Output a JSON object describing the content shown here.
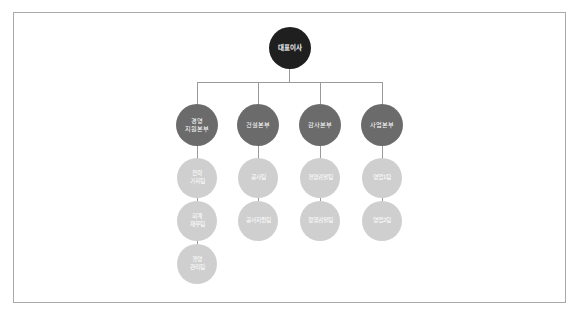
{
  "diagram": {
    "type": "org-chart",
    "root": {
      "label": "대표이사"
    },
    "divisions": [
      {
        "label": "경영\n지원본부",
        "teams": [
          {
            "label": "전략\n기획팀"
          },
          {
            "label": "회계\n재무팀"
          },
          {
            "label": "경영\n관리팀"
          }
        ]
      },
      {
        "label": "건설본부",
        "teams": [
          {
            "label": "공사팀"
          },
          {
            "label": "공사지원팀"
          }
        ]
      },
      {
        "label": "감사본부",
        "teams": [
          {
            "label": "경영감찰팀"
          },
          {
            "label": "정행감찰팀"
          }
        ]
      },
      {
        "label": "사업본부",
        "teams": [
          {
            "label": "영업1팀"
          },
          {
            "label": "영업2팀"
          }
        ]
      }
    ],
    "colors": {
      "root": "#1f1f1f",
      "division": "#6b6b6b",
      "team": "#cfcfcf",
      "connector": "#9a9a9a",
      "frame_border": "#a9a9a9"
    }
  }
}
